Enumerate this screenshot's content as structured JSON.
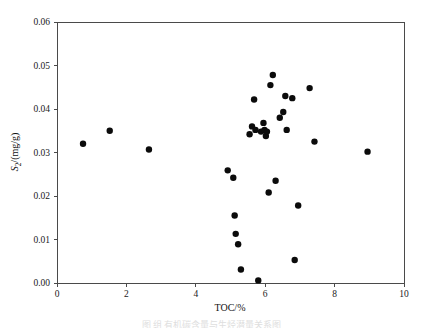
{
  "figure": {
    "background_color": "#ffffff",
    "axis_color": "#4a4a4a",
    "marker_color": "#0b0b0b",
    "caption": "图 组 有机碳含量与生烃潜量关系图"
  },
  "chart_data": {
    "type": "scatter",
    "title": "",
    "xlabel": "TOC/%",
    "ylabel": "S2/(mg/g)",
    "ylabel_parts": {
      "symbol": "S",
      "subscript": "2",
      "units": "/(mg/g)"
    },
    "xlim": [
      0,
      10
    ],
    "ylim": [
      0,
      0.06
    ],
    "xticks": [
      0,
      2,
      4,
      6,
      8,
      10
    ],
    "xtick_labels": [
      "0",
      "2",
      "4",
      "6",
      "8",
      "10"
    ],
    "yticks": [
      0.0,
      0.01,
      0.02,
      0.03,
      0.04,
      0.05,
      0.06
    ],
    "ytick_labels": [
      "0.00",
      "0.01",
      "0.02",
      "0.03",
      "0.04",
      "0.05",
      "0.06"
    ],
    "grid": false,
    "legend": null,
    "marker": "filled-circle",
    "marker_size_px": 4.6,
    "n_points": 33,
    "series": [
      {
        "name": "samples",
        "points": [
          [
            0.75,
            0.032
          ],
          [
            1.52,
            0.035
          ],
          [
            2.65,
            0.0307
          ],
          [
            4.92,
            0.0259
          ],
          [
            5.08,
            0.0242
          ],
          [
            5.12,
            0.0155
          ],
          [
            5.15,
            0.0113
          ],
          [
            5.22,
            0.0089
          ],
          [
            5.3,
            0.0031
          ],
          [
            5.55,
            0.0342
          ],
          [
            5.62,
            0.036
          ],
          [
            5.68,
            0.0422
          ],
          [
            5.72,
            0.0352
          ],
          [
            5.8,
            0.0006
          ],
          [
            5.88,
            0.0348
          ],
          [
            5.95,
            0.0368
          ],
          [
            5.98,
            0.0352
          ],
          [
            6.02,
            0.0338
          ],
          [
            6.05,
            0.0348
          ],
          [
            6.1,
            0.0208
          ],
          [
            6.15,
            0.0455
          ],
          [
            6.22,
            0.0478
          ],
          [
            6.3,
            0.0235
          ],
          [
            6.42,
            0.038
          ],
          [
            6.52,
            0.0393
          ],
          [
            6.58,
            0.043
          ],
          [
            6.62,
            0.0352
          ],
          [
            6.78,
            0.0425
          ],
          [
            6.85,
            0.0053
          ],
          [
            6.95,
            0.0178
          ],
          [
            7.28,
            0.0448
          ],
          [
            7.42,
            0.0325
          ],
          [
            8.95,
            0.0302
          ]
        ]
      }
    ]
  }
}
